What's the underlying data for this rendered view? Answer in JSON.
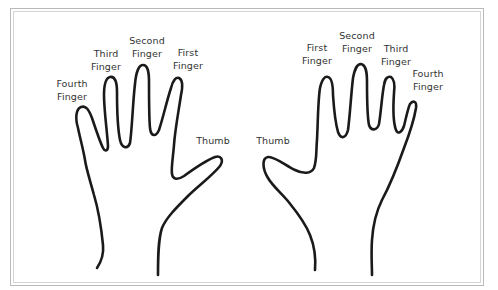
{
  "diagram": {
    "type": "labeled hand outlines",
    "stroke_color": "#1a1a1a",
    "label_color": "#333333",
    "frame_color": "#b9b9b9",
    "left_hand": {
      "labels": {
        "fourth": [
          "Fourth",
          "Finger"
        ],
        "third": [
          "Third",
          "Finger"
        ],
        "second": [
          "Second",
          "Finger"
        ],
        "first": [
          "First",
          "Finger"
        ],
        "thumb": "Thumb"
      }
    },
    "right_hand": {
      "labels": {
        "first": [
          "First",
          "Finger"
        ],
        "second": [
          "Second",
          "Finger"
        ],
        "third": [
          "Third",
          "Finger"
        ],
        "fourth": [
          "Fourth",
          "Finger"
        ],
        "thumb": "Thumb"
      }
    }
  }
}
